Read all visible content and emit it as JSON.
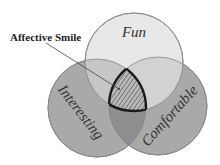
{
  "diagram": {
    "type": "venn",
    "sets": [
      {
        "id": "fun",
        "label": "Fun",
        "cx": 134,
        "cy": 62,
        "r": 49,
        "fill": "#e6e6e6"
      },
      {
        "id": "interesting",
        "label": "Interesting",
        "cx": 97,
        "cy": 108,
        "r": 49,
        "fill": "#a8a8a8"
      },
      {
        "id": "comfortable",
        "label": "Comfortable",
        "cx": 158,
        "cy": 106,
        "r": 49,
        "fill": "#a8a8a8"
      }
    ],
    "callout": {
      "label": "Affective Smile",
      "target": "intersection of Fun, Interesting and Comfortable",
      "hatched": true
    },
    "colors": {
      "stroke": "#777777",
      "highlight_stroke": "#1a1a1a",
      "hatch": "#555555",
      "text": "#333333"
    }
  }
}
